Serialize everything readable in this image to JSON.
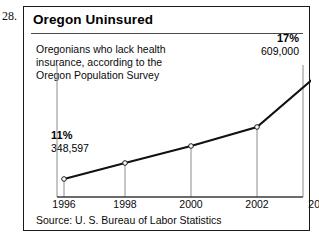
{
  "figure_number": "28.",
  "panel": {
    "title": "Oregon Uninsured",
    "caption_lines": [
      "Oregonians who lack health",
      "insurance, according to the",
      "Oregon Population Survey"
    ],
    "source": "Source: U. S. Bureau of Labor Statistics"
  },
  "annotations": {
    "start_percent": "11%",
    "start_value": "348,597",
    "end_percent": "17%",
    "end_value": "609,000"
  },
  "colors": {
    "line": "#111111",
    "marker_fill": "#ffffff",
    "marker_stroke": "#1a1a1a",
    "gridline": "#8c8c8c",
    "axis": "#3a3a3a",
    "frame": "#1a1a1a",
    "text": "#0a0a0a"
  },
  "chart_data": {
    "type": "line",
    "title": "Oregon Uninsured",
    "subtitle": "Oregonians who lack health insurance, according to the Oregon Population Survey",
    "xlabel": "",
    "ylabel": "",
    "x": [
      1996,
      1998,
      2000,
      2002,
      2004
    ],
    "categories": [
      "1996",
      "1998",
      "2000",
      "2002",
      "2004"
    ],
    "values": [
      348597,
      400000,
      450000,
      510000,
      609000
    ],
    "percent_labels": [
      "11%",
      null,
      null,
      null,
      "17%"
    ],
    "value_labels": [
      "348,597",
      null,
      null,
      null,
      "609,000"
    ],
    "series": [
      {
        "name": "Oregonians without health insurance",
        "values": [
          348597,
          400000,
          450000,
          510000,
          609000
        ]
      }
    ],
    "ylim": [
      300000,
      650000
    ],
    "xlim": [
      1996,
      2004
    ],
    "grid": "vertical-only",
    "legend": "none",
    "markers": "open-circle",
    "source": "Source: U. S. Bureau of Labor Statistics",
    "annotations": [
      {
        "x": 1996,
        "percent": "11%",
        "value": "348,597",
        "position": "above-right"
      },
      {
        "x": 2004,
        "percent": "17%",
        "value": "609,000",
        "position": "above-left"
      }
    ],
    "plot_points_px": [
      {
        "x": 40,
        "y": 172
      },
      {
        "x": 101,
        "y": 156
      },
      {
        "x": 167,
        "y": 139
      },
      {
        "x": 233,
        "y": 120
      },
      {
        "x": 296,
        "y": 66
      }
    ]
  }
}
